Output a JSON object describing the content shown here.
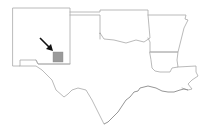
{
  "map": {
    "type": "locator-map",
    "region": "South-central United States",
    "states_shown": [
      "New Mexico",
      "Texas",
      "Oklahoma",
      "Arkansas",
      "Louisiana"
    ],
    "highlight": {
      "description": "Highlighted county-sized square in southeastern New Mexico",
      "color": "#9a9a9a"
    },
    "arrow": {
      "direction": "pointing down-right toward highlighted area",
      "color": "#111111"
    },
    "colors": {
      "background": "#ffffff",
      "border": "#a8a8a8"
    }
  }
}
